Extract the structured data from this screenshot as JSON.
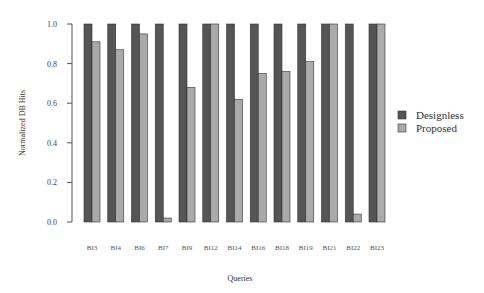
{
  "chart_data": {
    "type": "bar",
    "title": "",
    "xlabel": "Queries",
    "ylabel": "Normalized DB Hits",
    "ylim": [
      0,
      1.0
    ],
    "yticks": [
      "0.0",
      "0.2",
      "0.4",
      "0.6",
      "0.8",
      "1.0"
    ],
    "grid": false,
    "legend_position": "right",
    "categories": [
      "BI3",
      "BI4",
      "BI6",
      "BI7",
      "BI9",
      "BI12",
      "BI14",
      "BI16",
      "BI18",
      "BI19",
      "BI21",
      "BI22",
      "BI23"
    ],
    "series": [
      {
        "name": "Designless",
        "color": "#555555",
        "values": [
          1.0,
          1.0,
          1.0,
          1.0,
          1.0,
          1.0,
          1.0,
          1.0,
          1.0,
          1.0,
          1.0,
          1.0,
          1.0
        ]
      },
      {
        "name": "Proposed",
        "color": "#aaaaaa",
        "values": [
          0.91,
          0.87,
          0.95,
          0.02,
          0.68,
          1.0,
          0.62,
          0.75,
          0.76,
          0.81,
          1.0,
          0.04,
          1.0
        ]
      }
    ]
  }
}
